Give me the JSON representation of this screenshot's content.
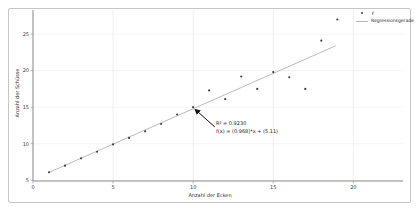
{
  "window": {
    "background": "#ffffff",
    "frame_border_color": "#c6c6c6"
  },
  "chart_data": {
    "type": "scatter",
    "title": "",
    "xlabel": "Anzahl der Ecken",
    "ylabel": "Anzahl der Schüsse",
    "xlim": [
      0,
      23.1
    ],
    "ylim": [
      4.9,
      28.3
    ],
    "xticks": [
      0,
      5,
      10,
      15,
      20
    ],
    "yticks": [
      5,
      10,
      15,
      20,
      25
    ],
    "grid": true,
    "axis_color": "#8c8c8c",
    "gridline_color": "#e9e9e9",
    "tick_label_color": "#3c3c3c",
    "series": [
      {
        "name": "y",
        "type": "scatter",
        "marker": "dot",
        "color": "#3f3f3f",
        "points": [
          [
            1,
            6.1
          ],
          [
            2,
            7
          ],
          [
            3,
            8
          ],
          [
            4,
            8.9
          ],
          [
            5,
            9.9
          ],
          [
            6,
            10.8
          ],
          [
            7,
            11.7
          ],
          [
            8,
            12.7
          ],
          [
            9,
            14
          ],
          [
            10,
            15
          ],
          [
            11,
            17.3
          ],
          [
            12,
            16.1
          ],
          [
            13,
            19.2
          ],
          [
            14,
            17.5
          ],
          [
            15,
            19.8
          ],
          [
            16,
            19.1
          ],
          [
            17,
            17.5
          ],
          [
            18,
            24.1
          ],
          [
            19,
            27
          ]
        ]
      },
      {
        "name": "Regressionsgerade",
        "type": "line",
        "color": "#b3b3b3",
        "slope": 0.968,
        "intercept": 5.11,
        "x_start": 1,
        "x_end": 18.9
      }
    ],
    "annotation": {
      "line1": "R² = 0.9230",
      "line2": "f(x) = (0.968)*x + (5.11)",
      "arrow_from": [
        11.35,
        12.3
      ],
      "arrow_to": [
        10.12,
        14.7
      ],
      "arrow_color": "#111111"
    },
    "legend": {
      "position": "top-right",
      "items": [
        {
          "label": "y",
          "marker": "dot"
        },
        {
          "label": "Regressionsgerade",
          "marker": "line"
        }
      ]
    }
  }
}
